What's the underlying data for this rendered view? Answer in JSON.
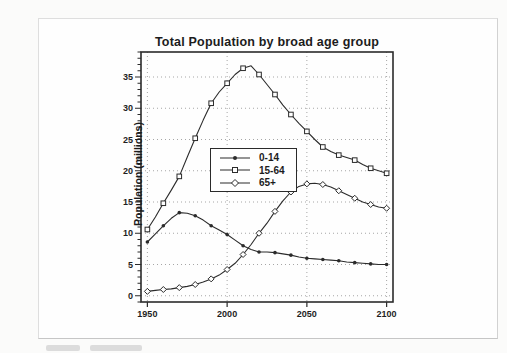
{
  "page": {
    "background": "#fbfbfa",
    "scan_border_color": "#dedede"
  },
  "chart": {
    "title": "Total Population by broad age group",
    "ylabel": "Population (millions)",
    "xtick_labels": [
      "1950",
      "2000",
      "2050",
      "2100"
    ],
    "ytick_labels": [
      "0",
      "5",
      "10",
      "15",
      "20",
      "25",
      "30",
      "35"
    ],
    "ink_color": "#2b2b2b",
    "grid_color": "#a6a6a6"
  },
  "chart_data": {
    "type": "line",
    "title": "Total Population by broad age group",
    "xlabel": "",
    "ylabel": "Population (millions)",
    "xlim": [
      1946,
      2104
    ],
    "ylim": [
      -1,
      39
    ],
    "grid": true,
    "legend_position": "inside-upper-left",
    "x": [
      1950,
      1955,
      1960,
      1965,
      1970,
      1975,
      1980,
      1985,
      1990,
      1995,
      2000,
      2005,
      2010,
      2015,
      2020,
      2025,
      2030,
      2035,
      2040,
      2045,
      2050,
      2055,
      2060,
      2065,
      2070,
      2075,
      2080,
      2085,
      2090,
      2095,
      2100
    ],
    "marker_every": 2,
    "series": [
      {
        "name": "0-14",
        "marker": "circle",
        "values": [
          8.6,
          9.9,
          11.2,
          12.4,
          13.3,
          13.2,
          12.8,
          12.1,
          11.2,
          10.5,
          9.8,
          8.9,
          8.0,
          7.4,
          7.0,
          7.0,
          6.9,
          6.7,
          6.5,
          6.2,
          6.0,
          5.9,
          5.8,
          5.7,
          5.6,
          5.4,
          5.3,
          5.2,
          5.1,
          5.0,
          5.0
        ]
      },
      {
        "name": "15-64",
        "marker": "square",
        "values": [
          10.6,
          12.6,
          14.8,
          16.9,
          19.1,
          22.2,
          25.2,
          28.1,
          30.8,
          32.6,
          34.0,
          35.4,
          36.4,
          36.8,
          35.4,
          33.8,
          32.2,
          30.5,
          29.0,
          27.6,
          26.3,
          25.0,
          23.8,
          23.1,
          22.5,
          22.1,
          21.7,
          21.0,
          20.4,
          20.0,
          19.6
        ]
      },
      {
        "name": "65+",
        "marker": "diamond",
        "values": [
          0.7,
          0.85,
          1.0,
          1.1,
          1.3,
          1.5,
          1.8,
          2.2,
          2.7,
          3.3,
          4.2,
          5.2,
          6.6,
          8.2,
          10.0,
          11.6,
          13.5,
          15.2,
          16.6,
          17.5,
          17.9,
          18.0,
          17.8,
          17.4,
          16.8,
          16.2,
          15.6,
          15.0,
          14.6,
          14.2,
          14.0
        ]
      }
    ]
  }
}
